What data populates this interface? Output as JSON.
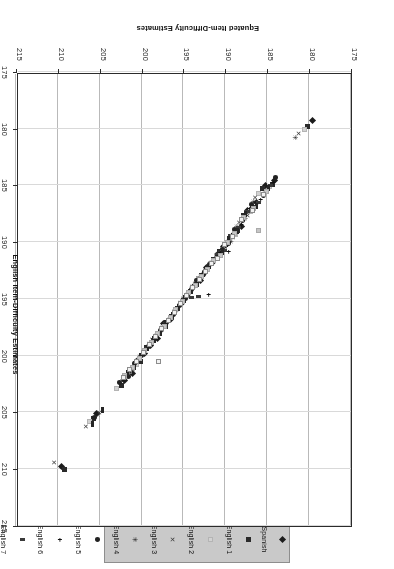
{
  "chart_data": {
    "type": "scatter",
    "title": "",
    "xlabel": "English Item-Difficulty Estimates",
    "ylabel": "Equated Item-Difficulty Estimates",
    "xlim": [
      175,
      215
    ],
    "ylim": [
      175,
      215
    ],
    "xticks": [
      175,
      180,
      185,
      190,
      195,
      200,
      205,
      210,
      215
    ],
    "yticks": [
      175,
      180,
      185,
      190,
      195,
      200,
      205,
      210,
      215
    ],
    "xtick_labels": [
      "175",
      "180",
      "185",
      "190",
      "195",
      "200",
      "205",
      "210",
      "215"
    ],
    "ytick_labels": [
      "175",
      "180",
      "185",
      "190",
      "195",
      "200",
      "205",
      "210",
      "215"
    ],
    "grid": "vertical-and-light-horizontal",
    "rotation_deg": 180,
    "legend_position": "top-outside",
    "legend_entries": [
      {
        "name": "Spanish",
        "marker": "diamond"
      },
      {
        "name": "English 1",
        "marker": "square"
      },
      {
        "name": "English 2",
        "marker": "light-square"
      },
      {
        "name": "English 3",
        "marker": "x"
      },
      {
        "name": "English 4",
        "marker": "star"
      },
      {
        "name": "English 5",
        "marker": "circle"
      },
      {
        "name": "English 6",
        "marker": "plus"
      },
      {
        "name": "English 7",
        "marker": "dash"
      },
      {
        "name": "English 8",
        "marker": "bar"
      },
      {
        "name": "English 9",
        "marker": "light-gray"
      },
      {
        "name": "English10",
        "marker": "open-square"
      }
    ],
    "series": [
      {
        "name": "Spanish",
        "marker": "diamond",
        "points": [
          [
            179.6,
            179.3
          ],
          [
            184.1,
            184.6
          ],
          [
            185.2,
            185.0
          ],
          [
            186.3,
            186.5
          ],
          [
            187.4,
            187.2
          ],
          [
            188.1,
            188.6
          ],
          [
            188.9,
            189.2
          ],
          [
            189.6,
            189.9
          ],
          [
            190.2,
            190.4
          ],
          [
            190.9,
            191.1
          ],
          [
            191.5,
            191.8
          ],
          [
            192.3,
            192.2
          ],
          [
            193.0,
            193.4
          ],
          [
            193.8,
            193.9
          ],
          [
            194.5,
            194.6
          ],
          [
            195.2,
            195.4
          ],
          [
            195.9,
            196.0
          ],
          [
            196.6,
            196.8
          ],
          [
            197.4,
            197.2
          ],
          [
            198.1,
            198.5
          ],
          [
            198.9,
            199.1
          ],
          [
            199.6,
            199.8
          ],
          [
            200.4,
            200.3
          ],
          [
            201.1,
            201.6
          ],
          [
            202.0,
            202.2
          ],
          [
            205.4,
            205.1
          ],
          [
            209.6,
            209.8
          ]
        ]
      },
      {
        "name": "English 1",
        "marker": "square",
        "points": [
          [
            180.2,
            179.8
          ],
          [
            184.4,
            184.9
          ],
          [
            185.6,
            185.3
          ],
          [
            186.8,
            186.9
          ],
          [
            187.8,
            187.6
          ],
          [
            188.5,
            189.0
          ],
          [
            189.3,
            189.5
          ],
          [
            190.0,
            190.2
          ],
          [
            190.7,
            190.8
          ],
          [
            191.4,
            191.5
          ],
          [
            192.1,
            192.4
          ],
          [
            192.8,
            192.9
          ],
          [
            193.5,
            193.7
          ],
          [
            194.2,
            194.3
          ],
          [
            195.0,
            195.1
          ],
          [
            195.7,
            195.8
          ],
          [
            196.4,
            196.5
          ],
          [
            197.1,
            197.4
          ],
          [
            197.9,
            198.0
          ],
          [
            198.6,
            198.7
          ],
          [
            199.4,
            199.3
          ],
          [
            200.1,
            200.5
          ],
          [
            201.0,
            201.0
          ],
          [
            202.4,
            202.6
          ],
          [
            205.8,
            205.5
          ],
          [
            209.2,
            210.0
          ]
        ]
      },
      {
        "name": "English 2",
        "marker": "light-square",
        "points": [
          [
            180.6,
            180.1
          ],
          [
            184.7,
            185.1
          ],
          [
            186.0,
            185.7
          ],
          [
            187.0,
            187.3
          ],
          [
            188.0,
            188.0
          ],
          [
            188.8,
            189.3
          ],
          [
            189.5,
            189.8
          ],
          [
            190.3,
            190.6
          ],
          [
            191.0,
            191.2
          ],
          [
            191.8,
            191.9
          ],
          [
            192.5,
            192.7
          ],
          [
            193.2,
            193.2
          ],
          [
            193.9,
            194.0
          ],
          [
            194.6,
            194.7
          ],
          [
            195.3,
            195.5
          ],
          [
            196.1,
            196.2
          ],
          [
            196.8,
            196.9
          ],
          [
            197.6,
            197.7
          ],
          [
            198.3,
            198.3
          ],
          [
            199.0,
            199.0
          ],
          [
            199.8,
            199.7
          ],
          [
            200.6,
            200.8
          ],
          [
            201.4,
            201.4
          ],
          [
            203.0,
            202.9
          ],
          [
            206.2,
            205.8
          ]
        ]
      },
      {
        "name": "English 3",
        "marker": "x",
        "points": [
          [
            181.2,
            180.4
          ],
          [
            185.0,
            185.4
          ],
          [
            186.4,
            186.1
          ],
          [
            187.3,
            187.6
          ],
          [
            188.3,
            188.3
          ],
          [
            189.1,
            189.6
          ],
          [
            189.8,
            190.0
          ],
          [
            190.6,
            190.9
          ],
          [
            191.3,
            191.5
          ],
          [
            192.0,
            192.2
          ],
          [
            192.9,
            193.0
          ],
          [
            193.6,
            193.6
          ],
          [
            194.3,
            194.4
          ],
          [
            195.0,
            195.0
          ],
          [
            195.6,
            195.8
          ],
          [
            196.4,
            196.5
          ],
          [
            197.2,
            197.2
          ],
          [
            198.0,
            198.0
          ],
          [
            198.7,
            198.6
          ],
          [
            199.4,
            199.4
          ],
          [
            200.2,
            200.1
          ],
          [
            201.0,
            201.2
          ],
          [
            201.9,
            201.8
          ],
          [
            205.0,
            205.0
          ],
          [
            206.6,
            206.2
          ],
          [
            210.4,
            209.4
          ]
        ]
      },
      {
        "name": "English 4",
        "marker": "star",
        "points": [
          [
            181.6,
            180.8
          ],
          [
            185.3,
            185.6
          ],
          [
            186.6,
            186.4
          ],
          [
            187.6,
            187.9
          ],
          [
            188.6,
            188.6
          ],
          [
            189.3,
            189.9
          ],
          [
            190.1,
            190.3
          ],
          [
            190.9,
            191.1
          ],
          [
            191.6,
            191.8
          ],
          [
            192.4,
            192.5
          ],
          [
            193.2,
            193.2
          ],
          [
            193.9,
            193.9
          ],
          [
            194.6,
            194.7
          ],
          [
            195.3,
            195.3
          ],
          [
            196.0,
            196.1
          ],
          [
            196.7,
            196.8
          ],
          [
            197.5,
            197.5
          ],
          [
            198.2,
            198.2
          ],
          [
            199.0,
            198.9
          ],
          [
            199.7,
            199.7
          ],
          [
            200.5,
            200.4
          ],
          [
            201.3,
            201.5
          ],
          [
            202.2,
            202.1
          ],
          [
            205.2,
            205.2
          ]
        ]
      },
      {
        "name": "English 5",
        "marker": "circle",
        "points": [
          [
            184.0,
            184.3
          ],
          [
            185.5,
            185.9
          ],
          [
            186.9,
            186.7
          ],
          [
            187.9,
            188.1
          ],
          [
            188.9,
            188.9
          ],
          [
            189.6,
            190.1
          ],
          [
            190.4,
            190.6
          ],
          [
            191.1,
            191.4
          ],
          [
            191.9,
            192.0
          ],
          [
            192.6,
            192.8
          ],
          [
            193.4,
            193.4
          ],
          [
            194.1,
            194.2
          ],
          [
            194.8,
            195.0
          ],
          [
            195.5,
            195.6
          ],
          [
            196.2,
            196.4
          ],
          [
            197.0,
            197.1
          ],
          [
            197.7,
            197.8
          ],
          [
            198.5,
            198.5
          ],
          [
            199.2,
            199.2
          ],
          [
            200.0,
            200.0
          ],
          [
            200.8,
            200.7
          ],
          [
            201.6,
            201.8
          ],
          [
            202.6,
            202.4
          ],
          [
            205.6,
            205.4
          ]
        ]
      },
      {
        "name": "English 6",
        "marker": "plus",
        "points": [
          [
            184.3,
            184.7
          ],
          [
            185.8,
            186.2
          ],
          [
            187.1,
            187.0
          ],
          [
            188.1,
            188.4
          ],
          [
            189.1,
            189.2
          ],
          [
            189.9,
            190.4
          ],
          [
            190.6,
            190.9
          ],
          [
            191.4,
            191.6
          ],
          [
            192.1,
            192.3
          ],
          [
            192.9,
            193.0
          ],
          [
            193.6,
            193.7
          ],
          [
            194.4,
            194.4
          ],
          [
            195.1,
            195.2
          ],
          [
            195.8,
            195.9
          ],
          [
            196.5,
            196.6
          ],
          [
            197.3,
            197.3
          ],
          [
            198.0,
            198.0
          ],
          [
            198.8,
            198.8
          ],
          [
            199.5,
            199.5
          ],
          [
            200.3,
            200.2
          ],
          [
            201.1,
            201.0
          ],
          [
            192.0,
            194.6
          ],
          [
            189.6,
            190.8
          ]
        ]
      },
      {
        "name": "English 7",
        "marker": "dash",
        "points": [
          [
            184.6,
            185.0
          ],
          [
            186.1,
            186.5
          ],
          [
            187.3,
            187.3
          ],
          [
            188.4,
            188.7
          ],
          [
            189.4,
            189.4
          ],
          [
            190.1,
            190.7
          ],
          [
            190.9,
            191.1
          ],
          [
            191.6,
            191.9
          ],
          [
            192.4,
            192.5
          ],
          [
            193.1,
            193.3
          ],
          [
            193.9,
            194.0
          ],
          [
            194.6,
            194.6
          ],
          [
            195.3,
            195.5
          ],
          [
            196.1,
            196.1
          ],
          [
            196.8,
            196.9
          ],
          [
            197.6,
            197.6
          ],
          [
            198.3,
            198.3
          ],
          [
            199.1,
            199.0
          ],
          [
            199.8,
            199.8
          ],
          [
            200.6,
            200.5
          ],
          [
            201.4,
            201.2
          ],
          [
            193.2,
            194.8
          ],
          [
            194.0,
            194.9
          ]
        ]
      },
      {
        "name": "English 8",
        "marker": "bar",
        "points": [
          [
            184.9,
            185.2
          ],
          [
            186.3,
            186.8
          ],
          [
            187.6,
            187.5
          ],
          [
            188.6,
            189.0
          ],
          [
            189.6,
            189.7
          ],
          [
            190.4,
            190.9
          ],
          [
            191.1,
            191.4
          ],
          [
            191.9,
            192.1
          ],
          [
            192.6,
            192.8
          ],
          [
            193.4,
            193.5
          ],
          [
            194.1,
            194.2
          ],
          [
            194.9,
            194.9
          ],
          [
            195.6,
            195.7
          ],
          [
            196.3,
            196.4
          ],
          [
            197.1,
            197.1
          ],
          [
            197.8,
            197.8
          ],
          [
            198.6,
            198.5
          ],
          [
            199.3,
            199.3
          ],
          [
            200.1,
            200.0
          ],
          [
            200.9,
            200.7
          ],
          [
            201.7,
            201.5
          ],
          [
            204.7,
            204.8
          ],
          [
            205.9,
            206.0
          ]
        ]
      },
      {
        "name": "English 9",
        "marker": "light-gray",
        "points": [
          [
            185.1,
            185.5
          ],
          [
            186.6,
            187.0
          ],
          [
            187.8,
            187.8
          ],
          [
            188.9,
            189.2
          ],
          [
            189.8,
            190.0
          ],
          [
            190.6,
            191.2
          ],
          [
            191.4,
            191.6
          ],
          [
            192.1,
            192.4
          ],
          [
            192.9,
            193.0
          ],
          [
            193.6,
            193.8
          ],
          [
            194.4,
            194.4
          ],
          [
            195.1,
            195.2
          ],
          [
            195.9,
            195.9
          ],
          [
            196.6,
            196.6
          ],
          [
            197.3,
            197.4
          ],
          [
            198.1,
            198.0
          ],
          [
            198.8,
            198.8
          ],
          [
            199.6,
            199.5
          ],
          [
            200.3,
            200.2
          ],
          [
            201.1,
            201.0
          ],
          [
            202.0,
            201.7
          ],
          [
            186.0,
            189.0
          ]
        ]
      },
      {
        "name": "English10",
        "marker": "open-square",
        "points": [
          [
            185.4,
            185.8
          ],
          [
            186.8,
            187.2
          ],
          [
            188.1,
            188.0
          ],
          [
            189.1,
            189.5
          ],
          [
            190.1,
            190.2
          ],
          [
            190.9,
            191.4
          ],
          [
            191.6,
            191.9
          ],
          [
            192.4,
            192.6
          ],
          [
            193.1,
            193.3
          ],
          [
            193.9,
            194.0
          ],
          [
            194.6,
            194.7
          ],
          [
            195.4,
            195.4
          ],
          [
            196.1,
            196.2
          ],
          [
            196.8,
            196.9
          ],
          [
            197.6,
            197.6
          ],
          [
            198.3,
            198.3
          ],
          [
            199.1,
            199.0
          ],
          [
            199.8,
            199.7
          ],
          [
            200.6,
            200.5
          ],
          [
            201.4,
            201.2
          ],
          [
            202.2,
            201.9
          ],
          [
            198.0,
            200.5
          ]
        ]
      }
    ]
  }
}
